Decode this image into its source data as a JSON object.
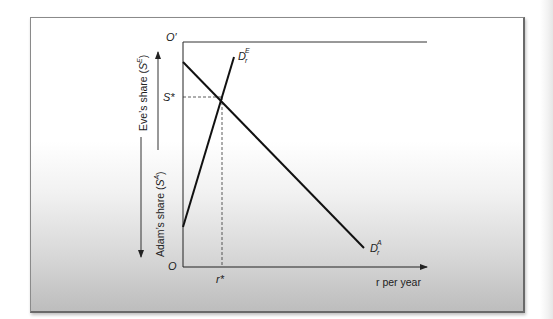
{
  "diagram": {
    "type": "edgeworth-box-demand",
    "origin_label": "O",
    "origin_prime_label": "O′",
    "s_star_label": "S*",
    "r_star_label": "r*",
    "x_axis_label": "r per year",
    "y_axis_left": {
      "eve": {
        "text": "Eve’s share (",
        "sym": "S",
        "sup": "E",
        "close": ")"
      },
      "adam": {
        "text": "Adam’s share (",
        "sym": "S",
        "sup": "A",
        "close": ")"
      }
    },
    "curves": [
      {
        "name": "D_r^E",
        "base": "D",
        "sub": "r",
        "sup": "E",
        "description": "Eve's demand, upward sloping",
        "from": [
          183,
          227
        ],
        "to": [
          234,
          57
        ]
      },
      {
        "name": "D_r^A",
        "base": "D",
        "sub": "r",
        "sup": "A",
        "description": "Adam's demand, downward sloping",
        "from": [
          183,
          62
        ],
        "to": [
          364,
          248
        ]
      }
    ],
    "equilibrium": {
      "x": 222,
      "y": 97
    },
    "colors": {
      "line": "#111111",
      "dashed": "#333333",
      "frame_border": "#6a6a6a"
    }
  }
}
